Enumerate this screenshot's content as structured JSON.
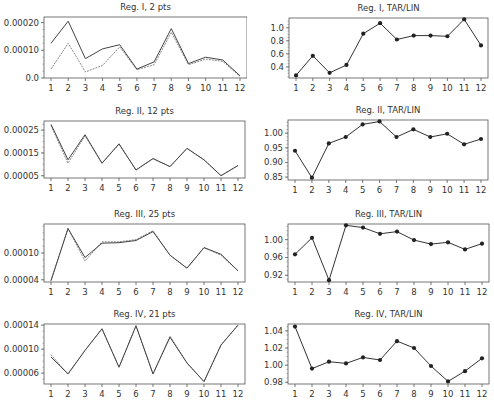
{
  "chart_data": [
    {
      "type": "line",
      "title": "Reg. I, 2 pts",
      "xlabel": "",
      "ylabel": "",
      "categories": [
        1,
        2,
        3,
        4,
        5,
        6,
        7,
        8,
        9,
        10,
        11,
        12
      ],
      "ylim": [
        0.0,
        0.00022
      ],
      "yticks": [
        0.0,
        0.0001,
        0.0002
      ],
      "ytick_labels": [
        "0.0",
        "0.00010",
        "0.00020"
      ],
      "grid": false,
      "legend": "none",
      "markers": false,
      "series": [
        {
          "name": "series-1",
          "style": "solid",
          "color": "#444444",
          "values": [
            0.000125,
            0.000205,
            7e-05,
            0.000105,
            0.00012,
            3.2e-05,
            5.8e-05,
            0.000178,
            5.2e-05,
            7.5e-05,
            6.5e-05,
            8e-06
          ]
        },
        {
          "name": "series-2",
          "style": "dashed",
          "color": "#888888",
          "values": [
            3.2e-05,
            0.000125,
            2.2e-05,
            4.5e-05,
            0.000112,
            3e-05,
            4.8e-05,
            0.000165,
            4.8e-05,
            6.8e-05,
            6e-05,
            6e-06
          ]
        }
      ]
    },
    {
      "type": "line",
      "title": "Reg. I, TAR/LIN",
      "xlabel": "",
      "ylabel": "",
      "categories": [
        1,
        2,
        3,
        4,
        5,
        6,
        7,
        8,
        9,
        10,
        11,
        12
      ],
      "ylim": [
        0.23,
        1.15
      ],
      "yticks": [
        0.4,
        0.6,
        0.8,
        1.0
      ],
      "ytick_labels": [
        "0.4",
        "0.6",
        "0.8",
        "1.0"
      ],
      "grid": false,
      "legend": "none",
      "markers": true,
      "series": [
        {
          "name": "ratio",
          "style": "solid",
          "color": "#333333",
          "values": [
            0.27,
            0.57,
            0.31,
            0.43,
            0.91,
            1.07,
            0.82,
            0.88,
            0.88,
            0.87,
            1.13,
            0.73
          ]
        }
      ]
    },
    {
      "type": "line",
      "title": "Reg. II, 12 pts",
      "xlabel": "",
      "ylabel": "",
      "categories": [
        1,
        2,
        3,
        4,
        5,
        6,
        7,
        8,
        9,
        10,
        11,
        12
      ],
      "ylim": [
        4e-05,
        0.00029
      ],
      "yticks": [
        5e-05,
        0.00015,
        0.00025
      ],
      "ytick_labels": [
        "0.00005",
        "0.00015",
        "0.00025"
      ],
      "grid": false,
      "legend": "none",
      "markers": false,
      "series": [
        {
          "name": "series-1",
          "style": "solid",
          "color": "#444444",
          "values": [
            0.000275,
            0.00012,
            0.00023,
            0.000105,
            0.00019,
            7.5e-05,
            0.000125,
            9e-05,
            0.00017,
            0.00012,
            5e-05,
            9.5e-05
          ]
        },
        {
          "name": "series-2",
          "style": "dashed",
          "color": "#888888",
          "values": [
            0.00027,
            0.000105,
            0.000225,
            0.000105,
            0.000188,
            7.5e-05,
            0.000125,
            9e-05,
            0.00017,
            0.00012,
            5e-05,
            9.5e-05
          ]
        }
      ]
    },
    {
      "type": "line",
      "title": "Reg. II, TAR/LIN",
      "xlabel": "",
      "ylabel": "",
      "categories": [
        1,
        2,
        3,
        4,
        5,
        6,
        7,
        8,
        9,
        10,
        11,
        12
      ],
      "ylim": [
        0.84,
        1.045
      ],
      "yticks": [
        0.85,
        0.9,
        0.95,
        1.0
      ],
      "ytick_labels": [
        "0.85",
        "0.90",
        "0.95",
        "1.00"
      ],
      "grid": false,
      "legend": "none",
      "markers": true,
      "series": [
        {
          "name": "ratio",
          "style": "solid",
          "color": "#333333",
          "values": [
            0.94,
            0.848,
            0.965,
            0.987,
            1.03,
            1.04,
            0.987,
            1.013,
            0.987,
            0.998,
            0.962,
            0.98
          ]
        }
      ]
    },
    {
      "type": "line",
      "title": "Reg. III, 25 pts",
      "xlabel": "",
      "ylabel": "",
      "categories": [
        1,
        2,
        3,
        4,
        5,
        6,
        7,
        8,
        9,
        10,
        11,
        12
      ],
      "ylim": [
        3.5e-05,
        0.000165
      ],
      "yticks": [
        4e-05,
        0.0001
      ],
      "ytick_labels": [
        "0.00004",
        "0.00010"
      ],
      "grid": false,
      "legend": "none",
      "markers": false,
      "series": [
        {
          "name": "series-1",
          "style": "solid",
          "color": "#444444",
          "values": [
            3.8e-05,
            0.000155,
            9e-05,
            0.000122,
            0.000123,
            0.000128,
            0.000148,
            9.5e-05,
            6.6e-05,
            0.000112,
            9.7e-05,
            6e-05
          ]
        },
        {
          "name": "series-2",
          "style": "dashed",
          "color": "#888888",
          "values": [
            3.8e-05,
            0.000155,
            8.2e-05,
            0.000125,
            0.000125,
            0.00013,
            0.00015,
            9.5e-05,
            6.6e-05,
            0.000112,
            9.5e-05,
            6e-05
          ]
        }
      ]
    },
    {
      "type": "line",
      "title": "Reg. III, TAR/LIN",
      "xlabel": "",
      "ylabel": "",
      "categories": [
        1,
        2,
        3,
        4,
        5,
        6,
        7,
        8,
        9,
        10,
        11,
        12
      ],
      "ylim": [
        0.905,
        1.035
      ],
      "yticks": [
        0.92,
        0.96,
        1.0
      ],
      "ytick_labels": [
        "0.92",
        "0.96",
        "1.00"
      ],
      "grid": false,
      "legend": "none",
      "markers": true,
      "series": [
        {
          "name": "ratio",
          "style": "solid",
          "color": "#333333",
          "values": [
            0.967,
            1.004,
            0.909,
            1.032,
            1.027,
            1.013,
            1.018,
            0.999,
            0.99,
            0.994,
            0.978,
            0.991
          ]
        }
      ]
    },
    {
      "type": "line",
      "title": "Reg. IV, 21 pts",
      "xlabel": "",
      "ylabel": "",
      "categories": [
        1,
        2,
        3,
        4,
        5,
        6,
        7,
        8,
        9,
        10,
        11,
        12
      ],
      "ylim": [
        4.2e-05,
        0.000142
      ],
      "yticks": [
        6e-05,
        0.0001,
        0.00014
      ],
      "ytick_labels": [
        "0.00006",
        "0.00010",
        "0.00014"
      ],
      "grid": false,
      "legend": "none",
      "markers": false,
      "series": [
        {
          "name": "series-1",
          "style": "solid",
          "color": "#444444",
          "values": [
            8.7e-05,
            5.9e-05,
            9.8e-05,
            0.000134,
            7e-05,
            0.000139,
            5.9e-05,
            0.00012,
            7.7e-05,
            4.6e-05,
            0.000107,
            0.00014
          ]
        },
        {
          "name": "series-2",
          "style": "dashed",
          "color": "#888888",
          "values": [
            9.1e-05,
            5.8e-05,
            9.8e-05,
            0.000134,
            7e-05,
            0.000139,
            5.8e-05,
            0.000122,
            7.7e-05,
            4.6e-05,
            0.000107,
            0.00014
          ]
        }
      ]
    },
    {
      "type": "line",
      "title": "Reg. IV, TAR/LIN",
      "xlabel": "",
      "ylabel": "",
      "categories": [
        1,
        2,
        3,
        4,
        5,
        6,
        7,
        8,
        9,
        10,
        11,
        12
      ],
      "ylim": [
        0.978,
        1.048
      ],
      "yticks": [
        0.98,
        1.0,
        1.02,
        1.04
      ],
      "ytick_labels": [
        "0.98",
        "1.00",
        "1.02",
        "1.04"
      ],
      "grid": false,
      "legend": "none",
      "markers": true,
      "series": [
        {
          "name": "ratio",
          "style": "solid",
          "color": "#333333",
          "values": [
            1.045,
            0.996,
            1.004,
            1.002,
            1.009,
            1.006,
            1.028,
            1.02,
            0.999,
            0.981,
            0.993,
            1.008
          ]
        }
      ]
    }
  ],
  "layout": {
    "panels": [
      {
        "x": 0,
        "y": 0,
        "plot": [
          44,
          17,
          203,
          61
        ]
      },
      {
        "x": 247,
        "y": 0,
        "plot": [
          42,
          18,
          199,
          60
        ]
      },
      {
        "x": 0,
        "y": 100,
        "plot": [
          44,
          21,
          201,
          57
        ]
      },
      {
        "x": 247,
        "y": 100,
        "plot": [
          41,
          20,
          200,
          60
        ]
      },
      {
        "x": 0,
        "y": 200,
        "plot": [
          44,
          24,
          201,
          58
        ]
      },
      {
        "x": 247,
        "y": 200,
        "plot": [
          41,
          24,
          201,
          58
        ]
      },
      {
        "x": 0,
        "y": 305,
        "plot": [
          44,
          19,
          201,
          60
        ]
      },
      {
        "x": 247,
        "y": 305,
        "plot": [
          41,
          19,
          201,
          60
        ]
      }
    ]
  }
}
